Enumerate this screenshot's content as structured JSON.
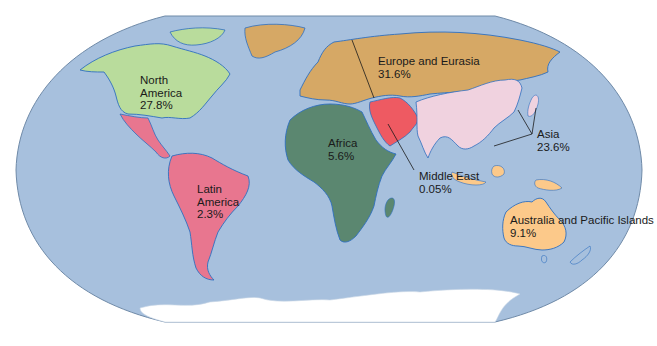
{
  "map": {
    "projection": "world-oval",
    "colors": {
      "ocean": "#a7c0dd",
      "ocean_border": "#6f8aa8",
      "coast": "#2f6fbf",
      "north_america": "#b9dc9c",
      "latin_america": "#e8768f",
      "europe_eurasia": "#d6a865",
      "africa": "#5b8770",
      "middle_east": "#ee5a62",
      "asia": "#f0d2df",
      "australia_pacific": "#fcc98a",
      "antarctica": "#ffffff",
      "leader_line": "#1a1a1a"
    },
    "regions": [
      {
        "id": "north_america",
        "name_lines": [
          "North",
          "America"
        ],
        "value": "27.8%"
      },
      {
        "id": "latin_america",
        "name_lines": [
          "Latin",
          "America"
        ],
        "value": "2.3%"
      },
      {
        "id": "europe_eurasia",
        "name_lines": [
          "Europe and Eurasia"
        ],
        "value": "31.6%"
      },
      {
        "id": "africa",
        "name_lines": [
          "Africa"
        ],
        "value": "5.6%"
      },
      {
        "id": "middle_east",
        "name_lines": [
          "Middle East"
        ],
        "value": "0.05%"
      },
      {
        "id": "asia",
        "name_lines": [
          "Asia"
        ],
        "value": "23.6%"
      },
      {
        "id": "australia_pacific",
        "name_lines": [
          "Australia and Pacific Islands"
        ],
        "value": "9.1%"
      }
    ]
  }
}
